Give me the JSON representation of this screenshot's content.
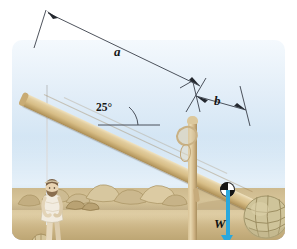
{
  "figure": {
    "type": "physics-diagram",
    "title": ""
  },
  "labels": {
    "distance_a": "a",
    "distance_b": "b",
    "angle": "25°",
    "weight": "W"
  },
  "colors": {
    "force_arrow": "#2aa8dd",
    "beam_wood": "#d7bd86",
    "sky_top": "#f4f9fd",
    "sky_bottom": "#c3dcf0",
    "ground": "#d9c79c",
    "hills": "#9a93ae",
    "annotation_line": "#3a3f4a",
    "label_text": "#161616"
  },
  "scene": {
    "elements": [
      "wooden-lever-beam",
      "vertical-support-post",
      "fulcrum-lashing",
      "pivot-ball",
      "netted-stone-load",
      "standing-person",
      "rope",
      "rocks",
      "distant-hills"
    ]
  },
  "annotations": {
    "dimension_a": {
      "label": "a",
      "description": "long arm from beam left end to fulcrum"
    },
    "dimension_b": {
      "label": "b",
      "description": "short arm from fulcrum to load"
    },
    "angle_marker": {
      "label": "25°",
      "description": "beam inclination from horizontal"
    },
    "force_vector": {
      "label": "W",
      "direction": "down",
      "description": "weight of load acting downward"
    }
  }
}
